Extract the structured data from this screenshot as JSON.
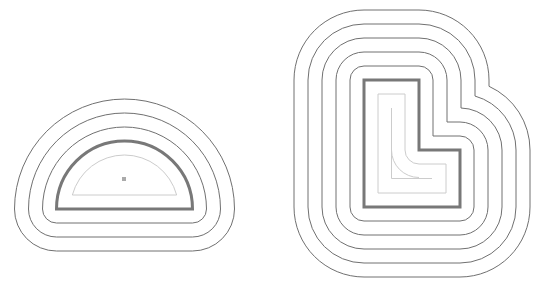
{
  "diagram": {
    "colors": {
      "offset_stroke": "#707070",
      "base_stroke": "#787878",
      "inner_stroke": "#cccccc",
      "center_dot": "#aaaaaa",
      "background": "#ffffff"
    },
    "semicircle": {
      "center": [
        124.5,
        209
      ],
      "radius": 68,
      "outward_offsets": [
        14,
        28,
        42
      ],
      "inward_offsets": [
        14
      ],
      "center_dot": [
        124,
        179
      ]
    },
    "l_shape": {
      "vertices": [
        [
          364,
          80
        ],
        [
          419,
          80
        ],
        [
          419,
          150
        ],
        [
          460,
          150
        ],
        [
          460,
          207
        ],
        [
          364,
          207
        ]
      ],
      "outward_offsets": [
        14,
        28,
        42,
        56,
        70
      ],
      "inward_offsets": [
        14
      ],
      "skeleton": true
    }
  }
}
